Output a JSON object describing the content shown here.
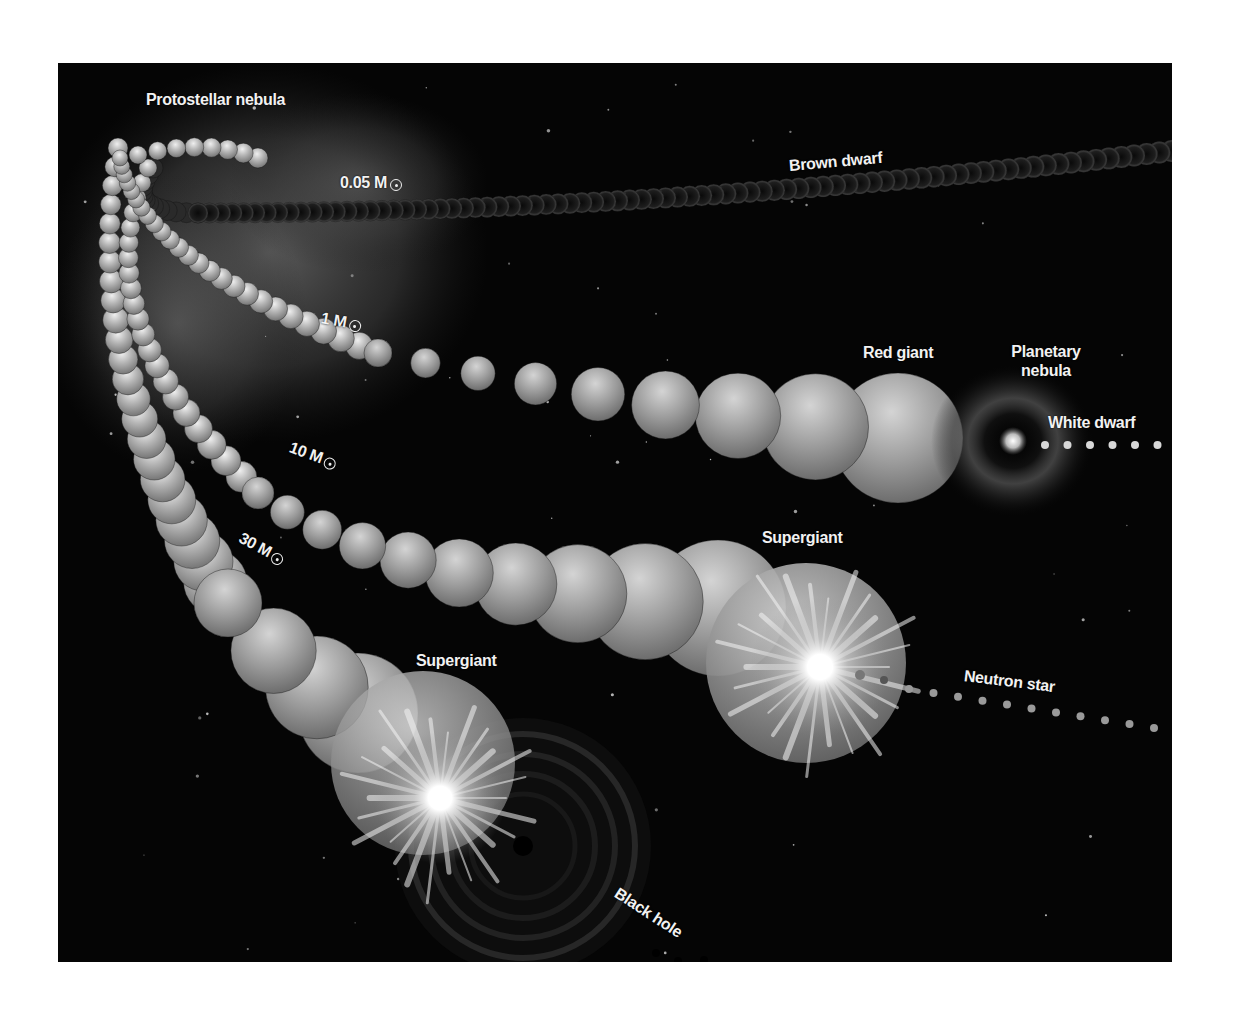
{
  "diagram": {
    "colors": {
      "background": "#050505",
      "page": "#ffffff",
      "label": "#f2f2f2",
      "bead": "#b8b8b8",
      "brown_dwarf_bead": "#2a2a2a"
    },
    "labels": {
      "protostellar_nebula": "Protostellar nebula",
      "mass_005": "0.05 M",
      "brown_dwarf": "Brown dwarf",
      "mass_1": "1 M",
      "red_giant": "Red giant",
      "planetary_nebula_line1": "Planetary",
      "planetary_nebula_line2": "nebula",
      "white_dwarf": "White dwarf",
      "mass_10": "10 M",
      "supergiant_10": "Supergiant",
      "neutron_star": "Neutron star",
      "mass_30": "30 M",
      "supergiant_30": "Supergiant",
      "black_hole": "Black hole"
    },
    "solar_symbol": "sun-symbol",
    "paths": [
      {
        "mass": "0.05 M☉",
        "stages": [
          "Protostellar nebula",
          "Brown dwarf"
        ]
      },
      {
        "mass": "1 M☉",
        "stages": [
          "Protostellar nebula",
          "Red giant",
          "Planetary nebula",
          "White dwarf"
        ]
      },
      {
        "mass": "10 M☉",
        "stages": [
          "Protostellar nebula",
          "Supergiant",
          "Neutron star"
        ]
      },
      {
        "mass": "30 M☉",
        "stages": [
          "Protostellar nebula",
          "Supergiant",
          "Black hole"
        ]
      }
    ]
  }
}
